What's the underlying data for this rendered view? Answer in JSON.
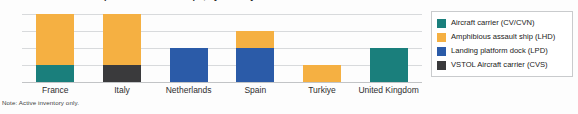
{
  "title": "Aircraft carriers and amphibious assault ships, by country",
  "note": "Note: Active inventory only.",
  "colors": {
    "cv_cvn": "#1A7F7C",
    "lhd": "#F5B042",
    "lpd": "#2B5BA8",
    "cvs": "#3A3A3C",
    "gridline": "#d8dadc",
    "background": "#fdfdfd",
    "legend_border": "#c9cbcd"
  },
  "legend": {
    "items": [
      {
        "label": "Aircraft carrier (CV/CVN)",
        "color": "#1A7F7C",
        "key": "cv_cvn"
      },
      {
        "label": "Amphibious assault ship (LHD)",
        "color": "#F5B042",
        "key": "lhd"
      },
      {
        "label": "Landing platform dock (LPD)",
        "color": "#2B5BA8",
        "key": "lpd"
      },
      {
        "label": "VSTOL Aircraft carrier (CVS)",
        "color": "#3A3A3C",
        "key": "cvs"
      }
    ]
  },
  "chart_data": {
    "type": "bar",
    "stacked": true,
    "title": "Aircraft carriers and amphibious assault ships, by country",
    "xlabel": "",
    "ylabel": "",
    "ylim": [
      0,
      4
    ],
    "yticks": [
      0,
      1,
      2,
      3,
      4
    ],
    "grid": true,
    "legend_position": "right",
    "categories": [
      "France",
      "Italy",
      "Netherlands",
      "Spain",
      "Turkiye",
      "United Kingdom"
    ],
    "series": [
      {
        "name": "Aircraft carrier (CV/CVN)",
        "color": "#1A7F7C",
        "values": [
          1,
          0,
          0,
          0,
          0,
          2
        ]
      },
      {
        "name": "Amphibious assault ship (LHD)",
        "color": "#F5B042",
        "values": [
          3,
          3,
          0,
          1,
          1,
          0
        ]
      },
      {
        "name": "Landing platform dock (LPD)",
        "color": "#2B5BA8",
        "values": [
          0,
          0,
          2,
          2,
          0,
          0
        ]
      },
      {
        "name": "VSTOL Aircraft carrier (CVS)",
        "color": "#3A3A3C",
        "values": [
          0,
          1,
          0,
          0,
          0,
          0
        ]
      }
    ],
    "totals": [
      4,
      4,
      2,
      3,
      1,
      2
    ],
    "stack_order": [
      "cv_cvn",
      "cvs",
      "lpd",
      "lhd"
    ],
    "annotations": [
      "Note: Active inventory only."
    ]
  }
}
